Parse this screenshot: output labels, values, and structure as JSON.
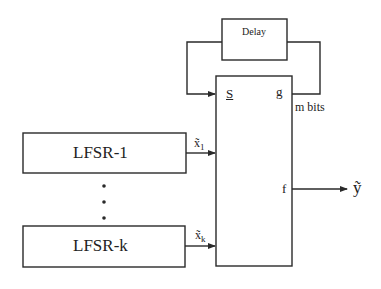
{
  "diagram": {
    "delay_block": {
      "label": "Delay"
    },
    "main_block": {
      "input_state_label": "S",
      "output_g_label": "g",
      "output_f_label": "f",
      "feedback_width_label": "m bits"
    },
    "lfsrs": [
      {
        "label": "LFSR-1",
        "output_symbol": "x̃",
        "output_subscript": "1"
      },
      {
        "label": "LFSR-k",
        "output_symbol": "x̃",
        "output_subscript": "k"
      }
    ],
    "ellipsis": "⋮",
    "output_label": "ỹ",
    "colors": {
      "stroke": "#2a2a2a",
      "background": "#ffffff"
    }
  }
}
